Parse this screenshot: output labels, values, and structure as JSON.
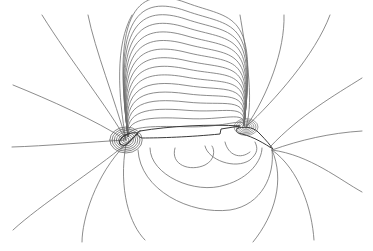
{
  "figure": {
    "kind": "contour-plot",
    "line_color": "#6e6e6e",
    "airfoil_color": "#3a3a3a",
    "background": "#ffffff"
  }
}
